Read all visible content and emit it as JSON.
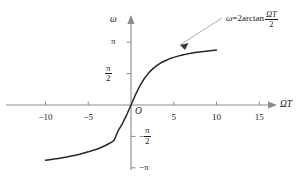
{
  "chart_data": {
    "type": "line",
    "title": "",
    "xlabel": "ΩT",
    "ylabel": "ω",
    "xlim": [
      -12.5,
      18.5
    ],
    "ylim": [
      -4.2,
      4.1
    ],
    "grid": false,
    "legend": null,
    "annotations": [
      {
        "name": "curve-equation",
        "text_plain": "ω=2arctan ΩT/2",
        "omega": "ω",
        "equals": "=2arctan",
        "numerator": "ΩT",
        "denominator": "2",
        "points_to_x": 5.2,
        "points_to_y": 2.55
      }
    ],
    "x_ticks": [
      {
        "value": -10,
        "label": "−10"
      },
      {
        "value": -5,
        "label": "−5"
      },
      {
        "value": 5,
        "label": "5"
      },
      {
        "value": 10,
        "label": "10"
      },
      {
        "value": 15,
        "label": "15"
      }
    ],
    "y_ticks": [
      {
        "value": 3.14159,
        "label": "π",
        "kind": "plain"
      },
      {
        "value": 1.5708,
        "label": "π/2",
        "kind": "fraction",
        "sign": "",
        "num": "π",
        "den": "2"
      },
      {
        "value": -1.5708,
        "label": "−π/2",
        "kind": "fraction",
        "sign": "−",
        "num": "π",
        "den": "2"
      },
      {
        "value": -3.14159,
        "label": "−π",
        "kind": "plain"
      }
    ],
    "origin_label": "O",
    "series": [
      {
        "name": "ω=2arctan(ΩT/2)",
        "formula": "y = 2*atan(x/2)",
        "color": "#262626",
        "x": [
          -10.0,
          -9.5,
          -9.0,
          -8.5,
          -8.0,
          -7.5,
          -7.0,
          -6.5,
          -6.0,
          -5.5,
          -5.0,
          -4.5,
          -4.0,
          -3.5,
          -3.0,
          -2.5,
          -2.0,
          -1.5,
          -1.0,
          -0.5,
          0.0,
          0.5,
          1.0,
          1.5,
          2.0,
          2.5,
          3.0,
          3.5,
          4.0,
          4.5,
          5.0,
          5.5,
          6.0,
          6.5,
          7.0,
          7.5,
          8.0,
          8.5,
          9.0,
          9.5,
          10.0
        ],
        "y": [
          -2.761,
          -2.733,
          -2.703,
          -2.67,
          -2.635,
          -2.597,
          -2.555,
          -2.509,
          -2.459,
          -2.403,
          -2.342,
          -2.273,
          -2.214,
          -2.122,
          -2.025,
          -1.914,
          -1.785,
          -1.287,
          -0.927,
          -0.49,
          0.0,
          0.49,
          0.927,
          1.287,
          1.571,
          1.794,
          1.971,
          2.112,
          2.214,
          2.309,
          2.382,
          2.443,
          2.498,
          2.544,
          2.585,
          2.62,
          2.651,
          2.679,
          2.703,
          2.726,
          2.747
        ]
      }
    ]
  },
  "axes": {
    "x_axis_arrow": true,
    "y_axis_arrow": true,
    "x_axis_name": "ΩT",
    "y_axis_name": "ω"
  },
  "colors": {
    "curve": "#262626",
    "axis": "#8c8c8c",
    "text": "#1a1a1a",
    "leader": "#9a9a9a",
    "background": "#ffffff"
  }
}
